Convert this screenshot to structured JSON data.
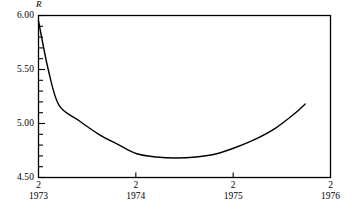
{
  "chart_data": {
    "type": "line",
    "title": "",
    "subtitle": "",
    "xlabel": "",
    "ylabel": "R",
    "ylim": [
      4.5,
      6.0
    ],
    "xlim": [
      1973.12,
      1976.12
    ],
    "grid": false,
    "legend": null,
    "y_ticks_major": [
      "6.00",
      "5.50",
      "5.00",
      "4.50"
    ],
    "y_tick_values_major": [
      6.0,
      5.5,
      5.0,
      4.5
    ],
    "y_minor_tick_step": 0.1,
    "x_ticks": [
      {
        "month": "2",
        "year": "1973",
        "value": 1973.12
      },
      {
        "month": "2",
        "year": "1974",
        "value": 1974.12
      },
      {
        "month": "2",
        "year": "1975",
        "value": 1975.12
      },
      {
        "month": "2",
        "year": "1976",
        "value": 1976.12
      }
    ],
    "series": [
      {
        "name": "R",
        "color": "#000000",
        "x": [
          1973.12,
          1973.22,
          1973.33,
          1973.53,
          1973.74,
          1973.95,
          1974.13,
          1974.33,
          1974.53,
          1974.74,
          1974.95,
          1975.15,
          1975.36,
          1975.56,
          1975.75,
          1975.86
        ],
        "values": [
          5.95,
          5.5,
          5.17,
          5.03,
          4.9,
          4.8,
          4.72,
          4.69,
          4.68,
          4.69,
          4.72,
          4.78,
          4.86,
          4.96,
          5.09,
          5.18
        ]
      }
    ]
  },
  "axis": {
    "y_name": "R"
  },
  "colors": {
    "line": "#000000",
    "frame": "#000000",
    "background": "#ffffff"
  }
}
